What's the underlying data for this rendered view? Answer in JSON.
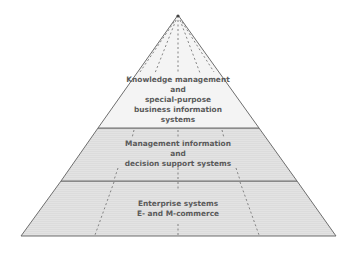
{
  "diagram": {
    "type": "pyramid",
    "colors": {
      "top_fill": "#f4f4f4",
      "mid_fill": "#e2e2e2",
      "base_fill": "#e2e2e2",
      "outline": "#6e6e6e",
      "text": "#5a5a5a"
    },
    "tiers": [
      {
        "name": "top",
        "lines": [
          "Knowledge management",
          "and",
          "special-purpose",
          "business information",
          "systems"
        ]
      },
      {
        "name": "middle",
        "lines": [
          "Management information",
          "and",
          "decision support systems"
        ]
      },
      {
        "name": "base",
        "lines": [
          "Enterprise systems",
          "E- and M-commerce"
        ]
      }
    ]
  }
}
